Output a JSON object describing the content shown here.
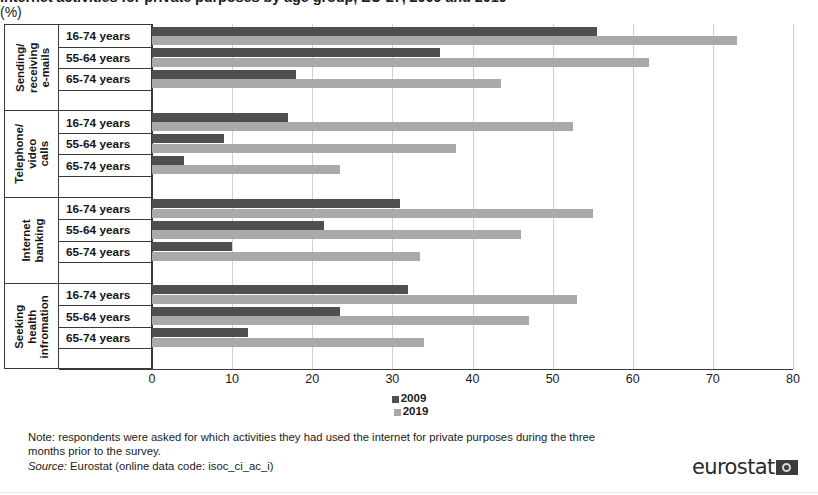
{
  "title": {
    "main": "Internet activities for private purposes by age group, EU-27, 2009 and 2019",
    "unit": "(%)"
  },
  "chart_data": {
    "type": "bar",
    "orientation": "horizontal",
    "title": "Internet activities for private purposes by age group, EU-27, 2009 and 2019 (%)",
    "xlabel": "",
    "ylabel": "",
    "xlim": [
      0,
      80
    ],
    "xticks": [
      0,
      10,
      20,
      30,
      40,
      50,
      60,
      70,
      80
    ],
    "grid": "vertical",
    "legend_position": "bottom-center",
    "groups": [
      {
        "name": "Sending/ receiving e-mails",
        "rows": [
          {
            "label": "16-74 years",
            "values": {
              "2009": 55.5,
              "2019": 73.0
            }
          },
          {
            "label": "55-64 years",
            "values": {
              "2009": 36.0,
              "2019": 62.0
            }
          },
          {
            "label": "65-74 years",
            "values": {
              "2009": 18.0,
              "2019": 43.5
            }
          }
        ]
      },
      {
        "name": "Telephone/ video calls",
        "rows": [
          {
            "label": "16-74 years",
            "values": {
              "2009": 17.0,
              "2019": 52.5
            }
          },
          {
            "label": "55-64 years",
            "values": {
              "2009": 9.0,
              "2019": 38.0
            }
          },
          {
            "label": "65-74 years",
            "values": {
              "2009": 4.0,
              "2019": 23.5
            }
          }
        ]
      },
      {
        "name": "Internet banking",
        "rows": [
          {
            "label": "16-74 years",
            "values": {
              "2009": 31.0,
              "2019": 55.0
            }
          },
          {
            "label": "55-64 years",
            "values": {
              "2009": 21.5,
              "2019": 46.0
            }
          },
          {
            "label": "65-74 years",
            "values": {
              "2009": 10.0,
              "2019": 33.5
            }
          }
        ]
      },
      {
        "name": "Seeking health infromation",
        "rows": [
          {
            "label": "16-74 years",
            "values": {
              "2009": 32.0,
              "2019": 53.0
            }
          },
          {
            "label": "55-64 years",
            "values": {
              "2009": 23.5,
              "2019": 47.0
            }
          },
          {
            "label": "65-74 years",
            "values": {
              "2009": 12.0,
              "2019": 34.0
            }
          }
        ]
      }
    ],
    "series": [
      {
        "name": "2009",
        "color": "#4f4f4f"
      },
      {
        "name": "2019",
        "color": "#a9a9a9"
      }
    ]
  },
  "legend": {
    "items": [
      {
        "label": "2009",
        "color": "#4f4f4f"
      },
      {
        "label": "2019",
        "color": "#a9a9a9"
      }
    ]
  },
  "footer": {
    "note_line1": "Note: respondents were asked for which activities they had used the internet for private purposes during the three",
    "note_line2": "months prior to the survey.",
    "source_label": "Source:",
    "source_text": " Eurostat (online data code: isoc_ci_ac_i)"
  },
  "branding": {
    "wordmark": "eurostat"
  }
}
